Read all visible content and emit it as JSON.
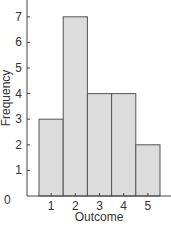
{
  "chart_data": {
    "type": "bar",
    "title": "",
    "xlabel": "Outcome",
    "ylabel": "Frequency",
    "categories": [
      "1",
      "2",
      "3",
      "4",
      "5"
    ],
    "values": [
      3,
      7,
      4,
      4,
      2
    ],
    "y_ticks": [
      "0",
      "1",
      "2",
      "3",
      "4",
      "5",
      "6",
      "7"
    ],
    "ylim": [
      0,
      7.6
    ],
    "grid": false,
    "legend": null,
    "bar_style": "histogram (adjacent bars)",
    "colors": {
      "bar_fill": "#dcdcdc",
      "bar_stroke": "#555555",
      "axis": "#444444"
    }
  }
}
